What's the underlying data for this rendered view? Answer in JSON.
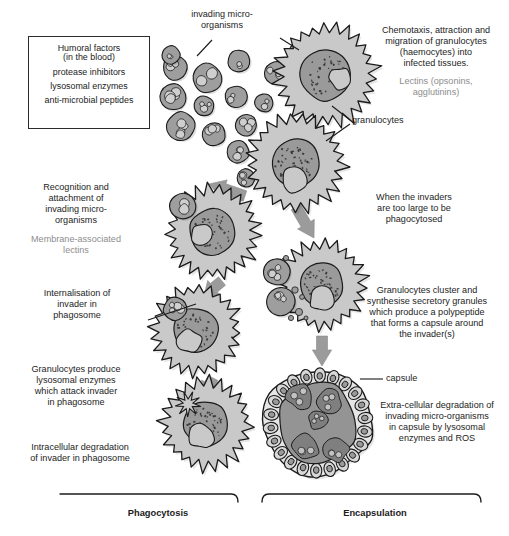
{
  "figure": {
    "type": "biological-process-diagram"
  },
  "humoral_box": {
    "name": "humoral-factors-box",
    "lines": [
      "Humoral factors",
      "(in the blood)",
      "protease inhibitors",
      "lysosomal enzymes",
      "anti-microbial peptides"
    ]
  },
  "labels": {
    "invading_microorganisms": "invading micro-\norganisms",
    "granulocytes": "granulocytes",
    "capsule": "capsule"
  },
  "annotations": {
    "chemotaxis": {
      "primary": "Chemotaxis, attraction and\nmigration of granulocytes\n(haemocytes) into\ninfected tissues.",
      "secondary": "Lectins (opsonins,\nagglutinins)"
    },
    "recognition": {
      "primary": "Recognition and\nattachment of\ninvading micro-\norganisms",
      "secondary": "Membrane-associated\nlectins"
    },
    "internalisation": "Internalisation of\ninvader in\nphagosome",
    "lysosomal": "Granulocytes produce\nlysosomal enzymes\nwhich attack invader\nin phagosome",
    "intracellular": "Intracellular degradation\nof invader in phagosome",
    "too_large": "When the invaders\nare too large to be\nphagocytosed",
    "cluster": "Granulocytes cluster and\nsynthesise secretory granules\nwhich produce a polypeptide\nthat forms a capsule around\nthe invader(s)",
    "extracellular": "Extra-cellular degradation of\ninvading micro-organisms\nin capsule by lysosomal\nenzymes and ROS"
  },
  "brackets": [
    {
      "name": "phagocytosis",
      "label": "Phagocytosis"
    },
    {
      "name": "encapsulation",
      "label": "Encapsulation"
    }
  ],
  "colors": {
    "outline": "#1b1b1b",
    "cytoplasm": "#c9c9c9",
    "nucleus": "#9a9a9a",
    "microbe_fill": "#9e9e9e",
    "microbe_inner": "#cfcfcf",
    "arrow": "#9b9b9b",
    "grey_text": "#8d8d8d",
    "capsule_core": "#949494",
    "background": "#ffffff"
  },
  "chart_data": {
    "type": "diagram",
    "pathways": [
      {
        "name": "Phagocytosis",
        "steps": [
          "Recognition and attachment of invading micro-organisms",
          "Internalisation of invader in phagosome",
          "Granulocytes produce lysosomal enzymes which attack invader in phagosome",
          "Intracellular degradation of invader in phagosome"
        ]
      },
      {
        "name": "Encapsulation",
        "steps": [
          "When the invaders are too large to be phagocytosed",
          "Granulocytes cluster and synthesise secretory granules which produce a polypeptide that forms a capsule around the invader(s)",
          "Extra-cellular degradation of invading micro-organisms in capsule by lysosomal enzymes and ROS"
        ]
      }
    ]
  }
}
